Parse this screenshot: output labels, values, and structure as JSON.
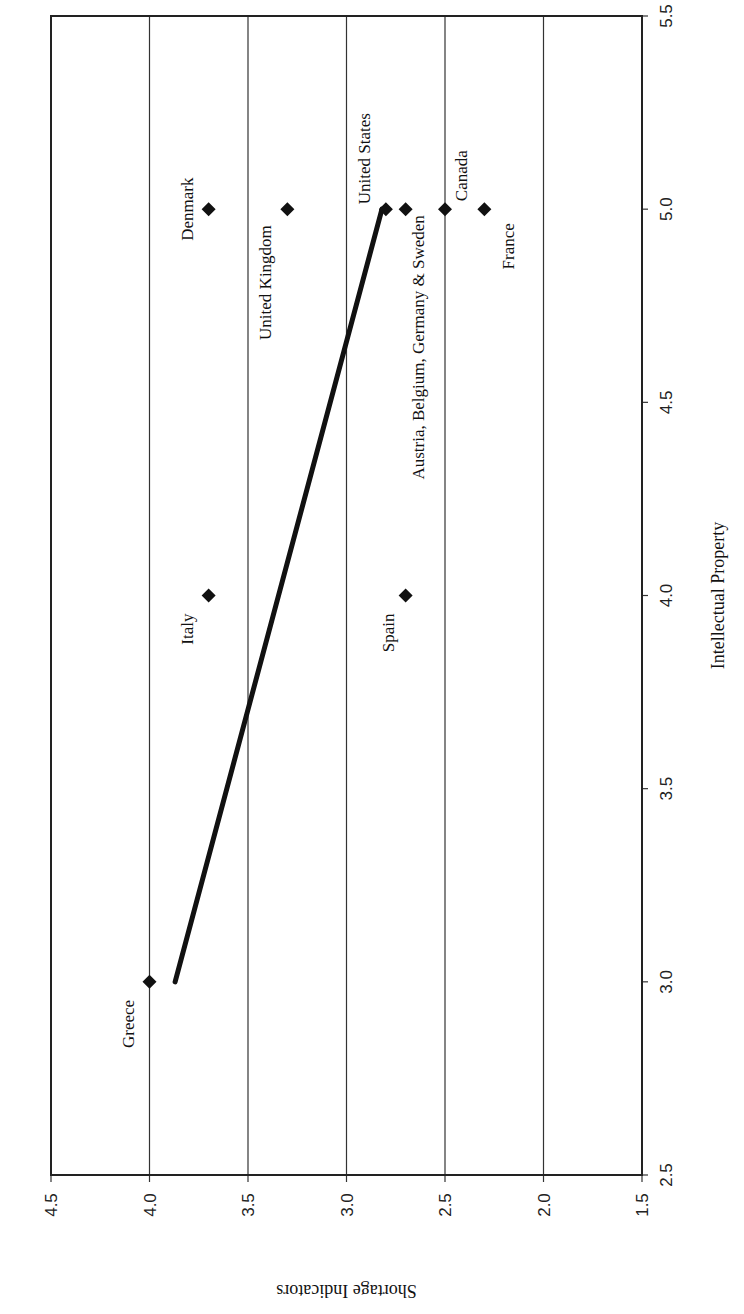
{
  "chart_data": {
    "type": "scatter",
    "orientation_note": "rendered rotated 90 degrees clockwise",
    "xlabel": "Intellectual Property",
    "ylabel": "Shortage Indicators",
    "xlim": [
      2.5,
      5.5
    ],
    "ylim": [
      1.5,
      4.5
    ],
    "x_ticks": [
      "2.5",
      "3.0",
      "3.5",
      "4.0",
      "4.5",
      "5.0",
      "5.5"
    ],
    "y_ticks": [
      "1.5",
      "2.0",
      "2.5",
      "3.0",
      "3.5",
      "4.0",
      "4.5"
    ],
    "grid": "horizontal gridlines at y ticks",
    "points": [
      {
        "label": "Greece",
        "x": 3.0,
        "y": 4.0
      },
      {
        "label": "Italy",
        "x": 4.0,
        "y": 3.7
      },
      {
        "label": "Spain",
        "x": 4.0,
        "y": 2.7
      },
      {
        "label": "Denmark",
        "x": 5.0,
        "y": 3.7
      },
      {
        "label": "United Kingdom",
        "x": 5.0,
        "y": 3.3
      },
      {
        "label": "United States",
        "x": 5.0,
        "y": 2.8
      },
      {
        "label": "Austria, Belgium, Germany & Sweden",
        "x": 5.0,
        "y": 2.7
      },
      {
        "label": "Canada",
        "x": 5.0,
        "y": 2.5
      },
      {
        "label": "France",
        "x": 5.0,
        "y": 2.3
      }
    ],
    "trendline": {
      "x": [
        3.0,
        5.0
      ],
      "y": [
        3.87,
        2.82
      ]
    },
    "marker": "diamond",
    "color": "#111111"
  }
}
